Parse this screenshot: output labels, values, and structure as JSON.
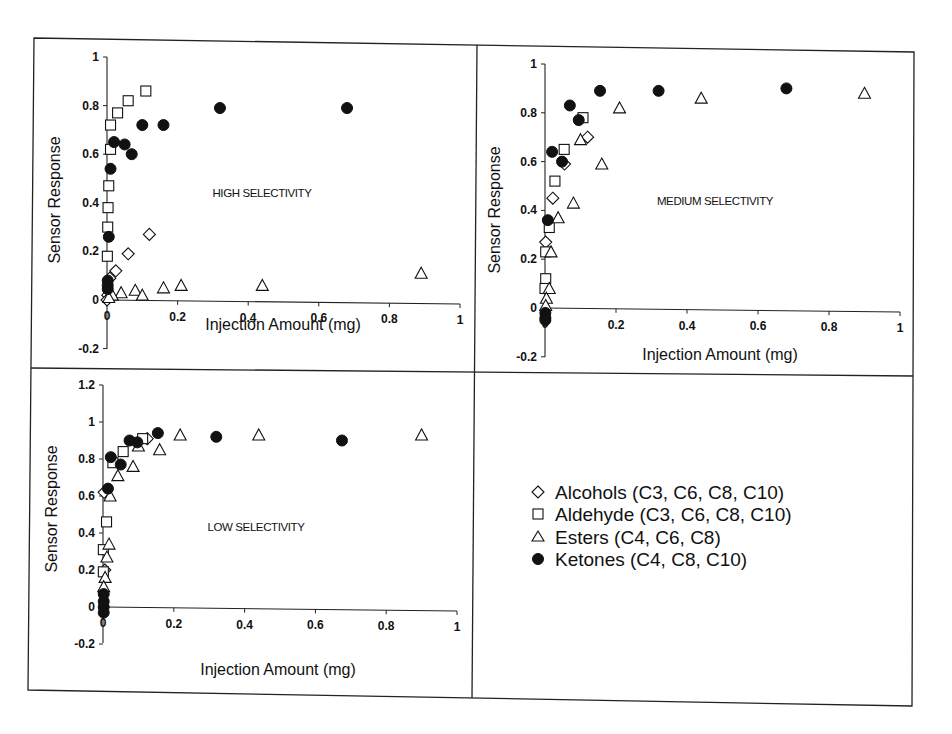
{
  "figure": {
    "legend": {
      "items": [
        {
          "marker": "diamond",
          "label": "Alcohols (C3, C6, C8, C10)"
        },
        {
          "marker": "square",
          "label": "Aldehyde (C3, C6, C8, C10)"
        },
        {
          "marker": "triangle",
          "label": "Esters (C4, C6, C8)"
        },
        {
          "marker": "circle",
          "label": "Ketones (C4, C8, C10)"
        }
      ]
    }
  },
  "chart_data": [
    {
      "type": "scatter",
      "title": "",
      "annotation": "HIGH SELECTIVITY",
      "xlabel": "Injection Amount (mg)",
      "ylabel": "Sensor Response",
      "xlim": [
        0,
        1
      ],
      "ylim": [
        -0.2,
        1
      ],
      "xticks": [
        "0",
        "0.2",
        "0.4",
        "0.6",
        "0.8",
        "1"
      ],
      "yticks": [
        "-0.2",
        "0",
        "0.2",
        "0.4",
        "0.6",
        "0.8",
        "1"
      ],
      "grid": false,
      "series": [
        {
          "name": "Alcohols (C3, C6, C8, C10)",
          "marker": "diamond",
          "points": [
            [
              0.12,
              0.27
            ],
            [
              0.06,
              0.19
            ],
            [
              0.025,
              0.12
            ],
            [
              0.008,
              0.09
            ],
            [
              0.002,
              0.02
            ],
            [
              0,
              0
            ]
          ]
        },
        {
          "name": "Aldehyde (C3, C6, C8, C10)",
          "marker": "square",
          "points": [
            [
              0.11,
              0.86
            ],
            [
              0.06,
              0.82
            ],
            [
              0.03,
              0.77
            ],
            [
              0.01,
              0.72
            ],
            [
              0.01,
              0.62
            ],
            [
              0.005,
              0.47
            ],
            [
              0.003,
              0.38
            ],
            [
              0.002,
              0.3
            ],
            [
              0.001,
              0.18
            ]
          ]
        },
        {
          "name": "Esters (C4, C6, C8)",
          "marker": "triangle",
          "points": [
            [
              0.89,
              0.11
            ],
            [
              0.44,
              0.06
            ],
            [
              0.21,
              0.06
            ],
            [
              0.16,
              0.05
            ],
            [
              0.08,
              0.04
            ],
            [
              0.1,
              0.02
            ],
            [
              0.04,
              0.03
            ],
            [
              0.015,
              0.02
            ],
            [
              0.005,
              0.01
            ]
          ]
        },
        {
          "name": "Ketones (C4, C8, C10)",
          "marker": "circle",
          "points": [
            [
              0.68,
              0.79
            ],
            [
              0.32,
              0.79
            ],
            [
              0.16,
              0.72
            ],
            [
              0.1,
              0.72
            ],
            [
              0.02,
              0.65
            ],
            [
              0.05,
              0.64
            ],
            [
              0.07,
              0.6
            ],
            [
              0.01,
              0.54
            ],
            [
              0.005,
              0.26
            ],
            [
              0.002,
              0.08
            ],
            [
              0.002,
              0.06
            ],
            [
              0.002,
              0.045
            ]
          ]
        }
      ]
    },
    {
      "type": "scatter",
      "title": "",
      "annotation": "MEDIUM SELECTIVITY",
      "xlabel": "Injection Amount (mg)",
      "ylabel": "Sensor Response",
      "xlim": [
        0,
        1
      ],
      "ylim": [
        -0.2,
        1
      ],
      "xticks": [
        "0",
        "0.2",
        "0.4",
        "0.6",
        "0.8",
        "1"
      ],
      "yticks": [
        "-0.2",
        "0",
        "0.2",
        "0.4",
        "0.6",
        "0.8",
        "1"
      ],
      "grid": false,
      "series": [
        {
          "name": "Alcohols (C3, C6, C8, C10)",
          "marker": "diamond",
          "points": [
            [
              0.12,
              0.7
            ],
            [
              0.055,
              0.59
            ],
            [
              0.022,
              0.45
            ],
            [
              0.002,
              0.27
            ]
          ]
        },
        {
          "name": "Aldehyde (C3, C6, C8, C10)",
          "marker": "square",
          "points": [
            [
              0.107,
              0.78
            ],
            [
              0.054,
              0.65
            ],
            [
              0.028,
              0.52
            ],
            [
              0.012,
              0.33
            ],
            [
              0.002,
              0.23
            ],
            [
              0.002,
              0.12
            ],
            [
              0.0,
              0.08
            ]
          ]
        },
        {
          "name": "Esters (C4, C6, C8)",
          "marker": "triangle",
          "points": [
            [
              0.9,
              0.88
            ],
            [
              0.44,
              0.86
            ],
            [
              0.21,
              0.82
            ],
            [
              0.1,
              0.69
            ],
            [
              0.16,
              0.59
            ],
            [
              0.08,
              0.43
            ],
            [
              0.037,
              0.37
            ],
            [
              0.017,
              0.23
            ],
            [
              0.012,
              0.08
            ],
            [
              0.004,
              0.04
            ],
            [
              0.002,
              0.01
            ]
          ]
        },
        {
          "name": "Ketones (C4, C8, C10)",
          "marker": "circle",
          "points": [
            [
              0.68,
              0.9
            ],
            [
              0.32,
              0.89
            ],
            [
              0.155,
              0.89
            ],
            [
              0.07,
              0.83
            ],
            [
              0.095,
              0.77
            ],
            [
              0.02,
              0.64
            ],
            [
              0.048,
              0.6
            ],
            [
              0.008,
              0.36
            ],
            [
              0.001,
              -0.02
            ],
            [
              0.001,
              -0.04
            ],
            [
              0.001,
              -0.05
            ]
          ]
        }
      ]
    },
    {
      "type": "scatter",
      "title": "",
      "annotation": "LOW SELECTIVITY",
      "xlabel": "Injection Amount (mg)",
      "ylabel": "Sensor Response",
      "xlim": [
        0,
        1
      ],
      "ylim": [
        -0.2,
        1.2
      ],
      "xticks": [
        "0",
        "0.2",
        "0.4",
        "0.6",
        "0.8",
        "1"
      ],
      "yticks": [
        "-0.2",
        "0",
        "0.2",
        "0.4",
        "0.6",
        "0.8",
        "1",
        "1.2"
      ],
      "grid": false,
      "series": [
        {
          "name": "Alcohols (C3, C6, C8, C10)",
          "marker": "diamond",
          "points": [
            [
              0.125,
              0.91
            ],
            [
              0.003,
              0.62
            ],
            [
              0.005,
              0.2
            ]
          ]
        },
        {
          "name": "Aldehyde (C3, C6, C8, C10)",
          "marker": "square",
          "points": [
            [
              0.112,
              0.91
            ],
            [
              0.057,
              0.84
            ],
            [
              0.028,
              0.78
            ],
            [
              0.01,
              0.46
            ],
            [
              0.001,
              0.31
            ],
            [
              0.001,
              0.19
            ]
          ]
        },
        {
          "name": "Esters (C4, C6, C8)",
          "marker": "triangle",
          "points": [
            [
              0.9,
              0.93
            ],
            [
              0.44,
              0.93
            ],
            [
              0.218,
              0.93
            ],
            [
              0.16,
              0.85
            ],
            [
              0.1,
              0.87
            ],
            [
              0.085,
              0.76
            ],
            [
              0.042,
              0.71
            ],
            [
              0.02,
              0.6
            ],
            [
              0.017,
              0.34
            ],
            [
              0.011,
              0.27
            ],
            [
              0.006,
              0.16
            ],
            [
              0.002,
              0.11
            ]
          ]
        },
        {
          "name": "Ketones (C4, C8, C10)",
          "marker": "circle",
          "points": [
            [
              0.675,
              0.9
            ],
            [
              0.32,
              0.92
            ],
            [
              0.155,
              0.94
            ],
            [
              0.075,
              0.9
            ],
            [
              0.097,
              0.89
            ],
            [
              0.022,
              0.81
            ],
            [
              0.05,
              0.77
            ],
            [
              0.014,
              0.64
            ],
            [
              0.002,
              0.07
            ],
            [
              0.002,
              0.03
            ],
            [
              0.002,
              0.0
            ],
            [
              0.002,
              -0.03
            ]
          ]
        }
      ]
    }
  ],
  "panels": [
    {
      "plot": {
        "x0": 107,
        "x1": 460,
        "y0": 300,
        "yUnit": 243,
        "axisBottom": 349,
        "axisTop": 57
      },
      "annotXY": [
        262,
        197
      ],
      "ylabelXY": [
        60,
        200
      ],
      "xlabelXY": [
        283,
        330
      ]
    },
    {
      "plot": {
        "x0": 545,
        "x1": 900,
        "y0": 308,
        "yUnit": 244,
        "axisBottom": 357,
        "axisTop": 64
      },
      "annotXY": [
        715,
        205
      ],
      "ylabelXY": [
        500,
        210
      ],
      "xlabelXY": [
        720,
        360
      ]
    },
    {
      "plot": {
        "x0": 103,
        "x1": 457,
        "y0": 607,
        "yUnit": 185,
        "axisBottom": 643,
        "axisTop": 385
      },
      "annotXY": [
        256,
        531
      ],
      "ylabelXY": [
        57,
        509
      ],
      "xlabelXY": [
        278,
        675
      ]
    }
  ]
}
